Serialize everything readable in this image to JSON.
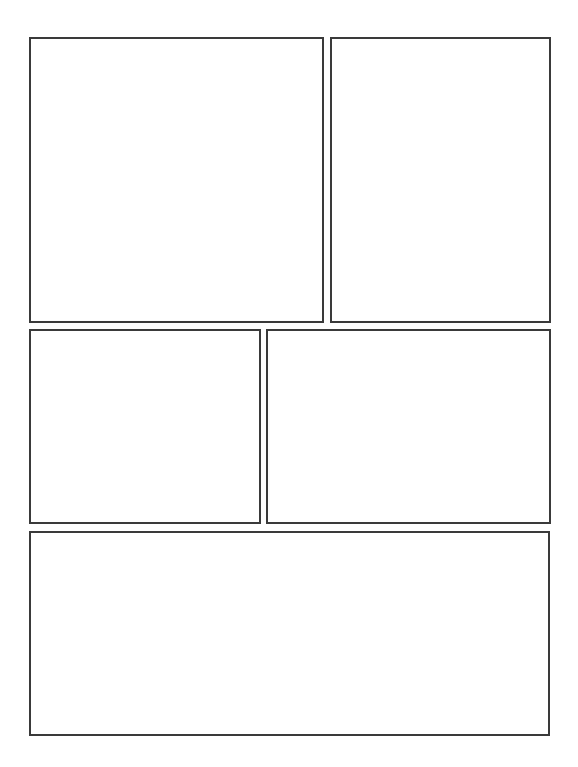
{
  "page": {
    "type": "blank comic page template",
    "background": "#ffffff",
    "border_color": "#3a3a3a",
    "panel_count": 5
  },
  "panels": [
    {
      "id": 1,
      "left": 29,
      "top": 37,
      "width": 295,
      "height": 286
    },
    {
      "id": 2,
      "left": 330,
      "top": 37,
      "width": 221,
      "height": 286
    },
    {
      "id": 3,
      "left": 29,
      "top": 329,
      "width": 232,
      "height": 195
    },
    {
      "id": 4,
      "left": 266,
      "top": 329,
      "width": 285,
      "height": 195
    },
    {
      "id": 5,
      "left": 29,
      "top": 531,
      "width": 521,
      "height": 205
    }
  ]
}
